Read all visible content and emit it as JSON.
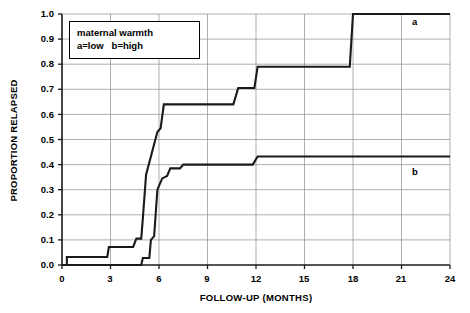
{
  "chart_data": {
    "type": "line",
    "subtype": "step-function-cumulative-incidence",
    "title": "",
    "xlabel": "FOLLOW-UP (MONTHS)",
    "ylabel": "PROPORTION RELAPSED",
    "xlim": [
      0,
      24
    ],
    "ylim": [
      0,
      1.0
    ],
    "xticks": [
      0,
      3,
      6,
      9,
      12,
      15,
      18,
      21,
      24
    ],
    "xtick_labels": [
      "0",
      "3",
      "6",
      "9",
      "12",
      "15",
      "18",
      "21",
      "24"
    ],
    "yticks": [
      0.0,
      0.1,
      0.2,
      0.3,
      0.4,
      0.5,
      0.6,
      0.7,
      0.8,
      0.9,
      1.0
    ],
    "ytick_labels": [
      "0.0",
      "0.1",
      "0.2",
      "0.3",
      "0.4",
      "0.5",
      "0.6",
      "0.7",
      "0.8",
      "0.9",
      "1.0"
    ],
    "grid": true,
    "grid_color": "#8c8c8c",
    "line_color": "#1a1a1a",
    "legend_position": "upper-left-inside",
    "annotations": [
      {
        "text": "a",
        "x": 22.0,
        "y": 0.975
      },
      {
        "text": "b",
        "x": 22.0,
        "y": 0.38
      }
    ],
    "series": [
      {
        "name": "a",
        "label": "a=low",
        "description": "low maternal warmth",
        "points": [
          [
            0.0,
            0.0
          ],
          [
            0.3,
            0.0
          ],
          [
            0.3,
            0.032
          ],
          [
            2.8,
            0.032
          ],
          [
            2.9,
            0.072
          ],
          [
            4.4,
            0.072
          ],
          [
            4.6,
            0.105
          ],
          [
            4.9,
            0.105
          ],
          [
            5.0,
            0.185
          ],
          [
            5.2,
            0.36
          ],
          [
            5.9,
            0.53
          ],
          [
            6.1,
            0.545
          ],
          [
            6.3,
            0.64
          ],
          [
            10.6,
            0.64
          ],
          [
            10.9,
            0.705
          ],
          [
            11.9,
            0.705
          ],
          [
            12.1,
            0.79
          ],
          [
            17.8,
            0.79
          ],
          [
            18.0,
            1.0
          ],
          [
            24.0,
            1.0
          ]
        ]
      },
      {
        "name": "b",
        "label": "b=high",
        "description": "high maternal warmth",
        "points": [
          [
            0.0,
            0.0
          ],
          [
            4.9,
            0.0
          ],
          [
            5.0,
            0.028
          ],
          [
            5.4,
            0.028
          ],
          [
            5.5,
            0.1
          ],
          [
            5.7,
            0.115
          ],
          [
            5.9,
            0.3
          ],
          [
            6.2,
            0.345
          ],
          [
            6.5,
            0.355
          ],
          [
            6.7,
            0.385
          ],
          [
            7.3,
            0.385
          ],
          [
            7.5,
            0.4
          ],
          [
            11.8,
            0.4
          ],
          [
            12.1,
            0.432
          ],
          [
            24.0,
            0.432
          ]
        ]
      }
    ]
  },
  "legend": {
    "title": "maternal warmth",
    "entries": "a=low   b=high"
  },
  "colors": {
    "plot_line": "#1a1a1a",
    "grid": "#8c8c8c",
    "axis": "#000000",
    "background": "#ffffff"
  }
}
